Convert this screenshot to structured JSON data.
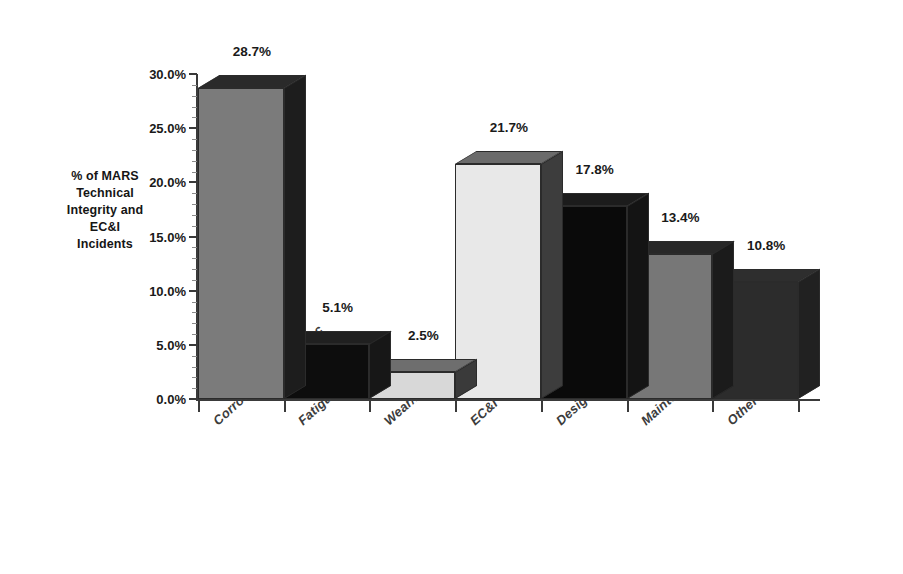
{
  "chart_data": {
    "type": "bar",
    "title": "",
    "subtitle": "",
    "xlabel": "",
    "ylabel": "% of MARS Technical Integrity and EC&I Incidents",
    "ylabel_lines": [
      "% of MARS",
      "Technical",
      "Integrity and",
      "EC&I",
      "Incidents"
    ],
    "categories": [
      "Corrosion/erosion/scc",
      "Fatigue/vibration",
      "Wear/friction",
      "EC&I",
      "Design",
      "Maintenance/repair",
      "Other"
    ],
    "values": [
      28.7,
      5.1,
      2.5,
      21.7,
      17.8,
      13.4,
      10.8
    ],
    "data_labels": [
      "28.7%",
      "5.1%",
      "2.5%",
      "21.7%",
      "17.8%",
      "13.4%",
      "10.8%"
    ],
    "ylim": [
      0,
      30
    ],
    "ytick_values": [
      0,
      5,
      10,
      15,
      20,
      25,
      30
    ],
    "ytick_labels": [
      "0.0%",
      "5.0%",
      "10.0%",
      "15.0%",
      "20.0%",
      "25.0%",
      "30.0%"
    ],
    "grid": false,
    "legend": "none",
    "bar_colors_front": [
      "#7b7b7b",
      "#0d0d0d",
      "#d8d8d8",
      "#e8e8e8",
      "#0a0a0a",
      "#777777",
      "#2c2c2c"
    ],
    "bar_colors_side": [
      "#1d1d1d",
      "#171717",
      "#3a3a3a",
      "#3d3d3d",
      "#141414",
      "#1b1b1b",
      "#212121"
    ],
    "bar_colors_top": [
      "#2a2a2a",
      "#202020",
      "#6e6e6e",
      "#6b6b6b",
      "#1c1c1c",
      "#282828",
      "#2e2e2e"
    ],
    "axis_color": "#3a3a3a",
    "text_color": "#1a1a1a"
  }
}
